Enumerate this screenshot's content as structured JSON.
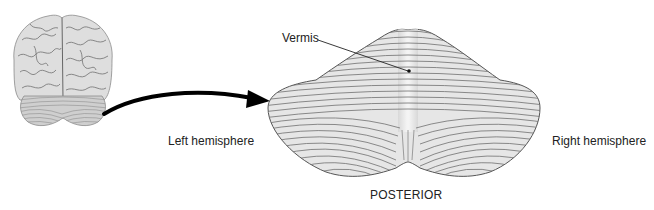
{
  "figure": {
    "labels": {
      "vermis": "Vermis",
      "left_hemisphere": "Left hemisphere",
      "right_hemisphere": "Right hemisphere",
      "posterior": "POSTERIOR"
    },
    "elements": {
      "brain_thumbnail": "posterior view of whole brain",
      "arrow": "curved arrow from brain to enlarged cerebellum",
      "cerebellum": "enlarged posterior view of cerebellum with folia"
    },
    "colors": {
      "background": "#ffffff",
      "text": "#222222",
      "cerebellum_fill": "#e4e4e4",
      "folia_lines": "#6a6a6a",
      "brain_fill": "#dcdcdc",
      "arrow": "#000000"
    }
  }
}
